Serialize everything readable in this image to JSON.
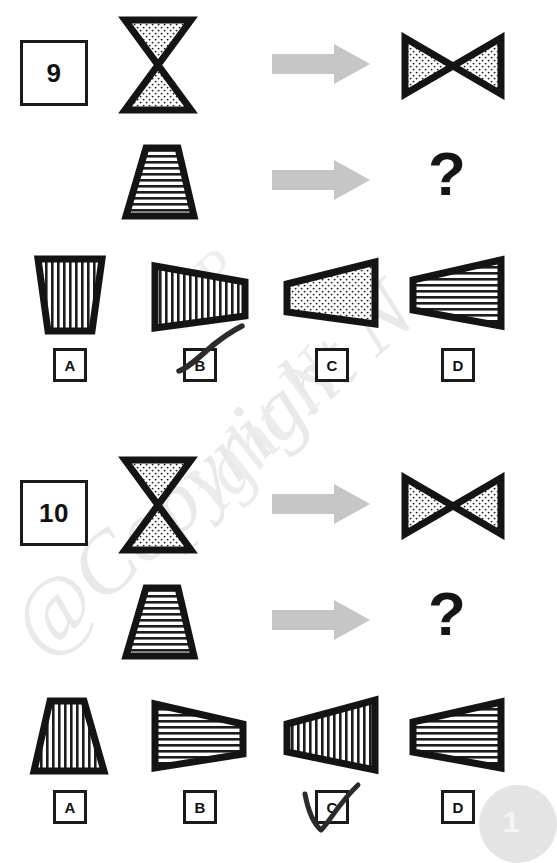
{
  "document": {
    "type": "non-verbal-reasoning-worksheet",
    "watermark_lines": [
      "@Copyright N",
      "ight N",
      "C P"
    ],
    "page_badge": "1"
  },
  "questions": [
    {
      "number": "9",
      "example_row": {
        "source_shape": {
          "name": "vertical-bowtie-dotted",
          "description": "Vertical hourglass / bowtie with dotted fill",
          "fill_pattern": "dots"
        },
        "arrow": "right-arrow",
        "result_shape": {
          "name": "horizontal-bowtie-dotted",
          "description": "Horizontal bowtie with dotted fill",
          "fill_pattern": "dots"
        }
      },
      "question_row": {
        "source_shape": {
          "name": "trapezoid-up-horizontal-stripes",
          "description": "Trapezoid narrow at top, wide at bottom, horizontal stripes",
          "fill_pattern": "horizontal-lines"
        },
        "arrow": "right-arrow",
        "result_placeholder": "?"
      },
      "options": [
        {
          "label": "A",
          "shape": {
            "name": "trapezoid-down-vertical-stripes",
            "description": "Trapezoid wide at top, narrow at bottom, vertical stripes",
            "fill_pattern": "vertical-lines"
          },
          "marked": false
        },
        {
          "label": "B",
          "shape": {
            "name": "trapezoid-left-tall-vertical-stripes",
            "description": "Trapezoid tall on left, short on right, vertical stripes",
            "fill_pattern": "vertical-lines"
          },
          "marked": true,
          "mark_type": "pen-stroke"
        },
        {
          "label": "C",
          "shape": {
            "name": "trapezoid-right-tall-dotted",
            "description": "Trapezoid short on left, tall on right, dotted fill",
            "fill_pattern": "dots"
          },
          "marked": false
        },
        {
          "label": "D",
          "shape": {
            "name": "trapezoid-right-tall-horizontal-stripes",
            "description": "Trapezoid short on left, tall on right, horizontal stripes",
            "fill_pattern": "horizontal-lines"
          },
          "marked": false
        }
      ]
    },
    {
      "number": "10",
      "example_row": {
        "source_shape": {
          "name": "vertical-bowtie-dotted",
          "description": "Vertical hourglass / bowtie with dotted fill",
          "fill_pattern": "dots"
        },
        "arrow": "right-arrow",
        "result_shape": {
          "name": "horizontal-bowtie-dotted",
          "description": "Horizontal bowtie with dotted fill",
          "fill_pattern": "dots"
        }
      },
      "question_row": {
        "source_shape": {
          "name": "trapezoid-up-horizontal-stripes",
          "description": "Trapezoid narrow at top, wide at bottom, horizontal stripes",
          "fill_pattern": "horizontal-lines"
        },
        "arrow": "right-arrow",
        "result_placeholder": "?"
      },
      "options": [
        {
          "label": "A",
          "shape": {
            "name": "trapezoid-up-vertical-stripes",
            "description": "Trapezoid narrow at top, wide at bottom, vertical stripes",
            "fill_pattern": "vertical-lines"
          },
          "marked": false
        },
        {
          "label": "B",
          "shape": {
            "name": "trapezoid-left-tall-horizontal-stripes",
            "description": "Trapezoid tall on left, short on right, horizontal stripes",
            "fill_pattern": "horizontal-lines"
          },
          "marked": false
        },
        {
          "label": "C",
          "shape": {
            "name": "trapezoid-right-tall-vertical-stripes",
            "description": "Trapezoid short on left, tall on right, vertical stripes",
            "fill_pattern": "vertical-lines"
          },
          "marked": true,
          "mark_type": "pen-checkmark"
        },
        {
          "label": "D",
          "shape": {
            "name": "trapezoid-right-tall-horizontal-stripes",
            "description": "Trapezoid short on left, tall on right, horizontal stripes",
            "fill_pattern": "horizontal-lines"
          },
          "marked": false
        }
      ]
    }
  ],
  "colors": {
    "ink": "#141414",
    "arrow": "#c6c6c6",
    "watermark": "#ebebec",
    "paper": "#ffffff"
  }
}
